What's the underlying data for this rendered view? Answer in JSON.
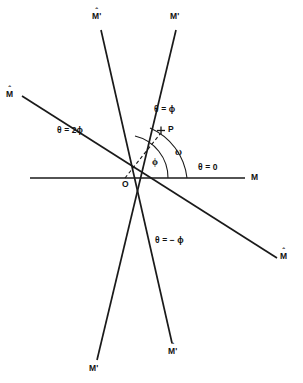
{
  "figure": {
    "type": "geometric-ray-diagram",
    "background_color": "#ffffff",
    "line_color": "#1a1a1a",
    "origin_label": "O",
    "point_label": "P",
    "point_marker": "+",
    "labels": {
      "axis_theta_zero": "θ = 0",
      "axis_m_right": "M",
      "ray_theta_phi": "θ = ϕ",
      "ray_theta_two_phi": "θ = 2ϕ",
      "ray_theta_minus_phi": "θ = − ϕ",
      "angle_phi": "ϕ",
      "angle_omega": "ω",
      "m_hat_upper_left": "M",
      "m_hat_lower_right": "M",
      "m_prime_top_right": "M'",
      "m_prime_bottom_left": "M'",
      "m_hat_prime_top_left": "M'",
      "m_hat_prime_bottom_right": "M'",
      "hat_mark": "ˆ"
    },
    "geometry": {
      "origin": {
        "x": 125,
        "y": 178
      },
      "axis_horizontal": {
        "x1": 30,
        "y1": 178,
        "x2": 245,
        "y2": 178
      },
      "ray_m_hat": {
        "x1": 22,
        "y1": 96,
        "x2": 277,
        "y2": 258
      },
      "ray_m_prime": {
        "x1": 176,
        "y1": 30,
        "x2": 97,
        "y2": 360
      },
      "ray_m_hat_prime": {
        "x1": 101,
        "y1": 30,
        "x2": 172,
        "y2": 343
      },
      "ray_to_p": {
        "x1": 125,
        "y1": 178,
        "x2": 161,
        "y2": 133
      },
      "arc_phi_radius": 43,
      "arc_omega_radius": 62
    }
  }
}
